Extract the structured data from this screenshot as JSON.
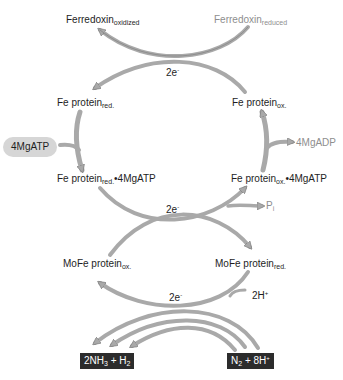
{
  "diagram": {
    "type": "nitrogenase reaction cycle",
    "colors": {
      "arrow": "#a9a9a9",
      "arrow_edge": "#7a7a7a",
      "text": "#1e1e1e",
      "muted_text": "#8e8e8e",
      "pill_bg": "#d6d6d6",
      "box_bg": "#2c2c2c"
    },
    "nodes": {
      "ferredoxin_ox": {
        "base": "Ferredoxin",
        "sub": "oxidized"
      },
      "ferredoxin_red": {
        "base": "Ferredoxin",
        "sub": "reduced"
      },
      "fe_red": {
        "base": "Fe protein",
        "sub": "red."
      },
      "fe_ox": {
        "base": "Fe protein",
        "sub": "ox."
      },
      "mgatp_in": {
        "text": "4MgATP"
      },
      "mgadp_out": {
        "text": "4MgADP"
      },
      "fe_red_atp": {
        "base": "Fe protein",
        "sub": "red.",
        "suffix": "•4MgATP"
      },
      "fe_ox_atp": {
        "base": "Fe protein",
        "sub": "ox.",
        "suffix": "•4MgATP"
      },
      "pi": {
        "base": "P",
        "sub": "i"
      },
      "mofe_ox": {
        "base": "MoFe protein",
        "sub": "ox."
      },
      "mofe_red": {
        "base": "MoFe protein",
        "sub": "red."
      },
      "protons": {
        "base": "2H",
        "sup": "+"
      },
      "products": {
        "p1": "2NH",
        "p1_sub": "3",
        "p2": " + H",
        "p2_sub": "2"
      },
      "substrates": {
        "s1": "N",
        "s1_sub": "2",
        "s2": " + 8H",
        "s2_sup": "+"
      }
    },
    "electron_labels": [
      {
        "base": "2e",
        "sup": "-"
      },
      {
        "base": "2e",
        "sup": "-"
      },
      {
        "base": "2e",
        "sup": "-"
      }
    ]
  }
}
